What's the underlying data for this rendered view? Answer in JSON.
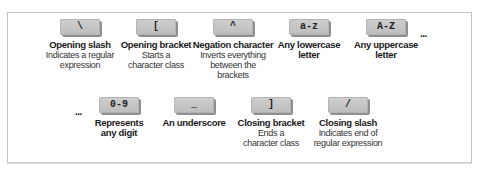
{
  "diagram": {
    "top_row": [
      {
        "key": "\\",
        "title": "Opening slash",
        "desc": "Indicates a regular expression"
      },
      {
        "key": "[",
        "title": "Opening bracket",
        "desc": "Starts a character class"
      },
      {
        "key": "^",
        "title": "Negation character",
        "desc": "Inverts everything between the brackets"
      },
      {
        "key": "a-z",
        "title": "Any lowercase letter",
        "desc": ""
      },
      {
        "key": "A-Z",
        "title": "Any uppercase letter",
        "desc": ""
      }
    ],
    "bottom_row": [
      {
        "key": "0-9",
        "title": "Represents any digit",
        "desc": ""
      },
      {
        "key": "_",
        "title": "An underscore",
        "desc": ""
      },
      {
        "key": "]",
        "title": "Closing bracket",
        "desc": "Ends a character class"
      },
      {
        "key": "/",
        "title": "Closing slash",
        "desc": "Indicates end of regular expression"
      }
    ],
    "ellipsis_top": "...",
    "ellipsis_bottom": "..."
  }
}
